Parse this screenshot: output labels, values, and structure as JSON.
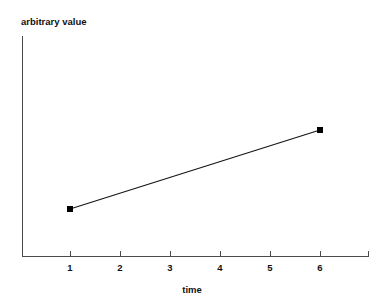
{
  "chart_data": {
    "type": "line",
    "title": "",
    "xlabel": "time",
    "ylabel": "arbitrary value",
    "x": [
      1,
      6
    ],
    "values": [
      1,
      2.4
    ],
    "series": [
      {
        "name": "arbitrary value",
        "x": [
          1,
          6
        ],
        "values": [
          1,
          2.4
        ],
        "marker": "filled-square",
        "color": "#000000"
      }
    ],
    "xticks": [
      1,
      2,
      3,
      4,
      5,
      6
    ],
    "xtick_labels": [
      "1",
      "2",
      "3",
      "4",
      "5",
      "6"
    ],
    "yticks": [],
    "ytick_labels": [],
    "xlim": [
      0.04,
      6.96
    ],
    "ylim": [
      0,
      3.4
    ],
    "grid": false,
    "legend": "none",
    "points": [
      {
        "x": 1,
        "y": 1,
        "px": 70,
        "py": 209
      },
      {
        "x": 6,
        "y": 2.4,
        "px": 320,
        "py": 130
      }
    ]
  },
  "axes": {
    "y_axis_label": "arbitrary value",
    "x_axis_label": "time",
    "x_tick_labels": [
      "1",
      "2",
      "3",
      "4",
      "5",
      "6"
    ]
  },
  "colors": {
    "background": "#ffffff",
    "axis": "#4a4a4a",
    "line": "#141414",
    "marker": "#000000",
    "text": "#111111"
  }
}
